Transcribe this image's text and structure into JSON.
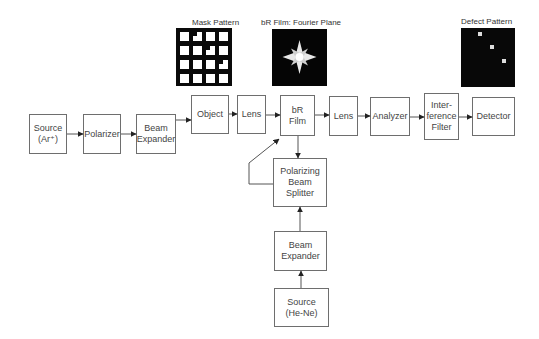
{
  "captions": {
    "mask": "Mask Pattern",
    "fourier": "bR Film: Fourier Plane",
    "defect": "Defect Pattern"
  },
  "main_path": [
    {
      "id": "source-ar",
      "label": "Source\n(Ar⁺)"
    },
    {
      "id": "polarizer",
      "label": "Polarizer"
    },
    {
      "id": "beam-expander-1",
      "label": "Beam\nExpander"
    },
    {
      "id": "object",
      "label": "Object"
    },
    {
      "id": "lens-1",
      "label": "Lens"
    },
    {
      "id": "br-film",
      "label": "bR\nFilm"
    },
    {
      "id": "lens-2",
      "label": "Lens"
    },
    {
      "id": "analyzer",
      "label": "Analyzer"
    },
    {
      "id": "interference-filter",
      "label": "Inter-\nference\nFilter"
    },
    {
      "id": "detector",
      "label": "Detector"
    }
  ],
  "reference_path": [
    {
      "id": "polarizing-beam-splitter",
      "label": "Polarizing\nBeam\nSplitter"
    },
    {
      "id": "beam-expander-2",
      "label": "Beam\nExpander"
    },
    {
      "id": "source-hene",
      "label": "Source\n(He-Ne)"
    }
  ]
}
